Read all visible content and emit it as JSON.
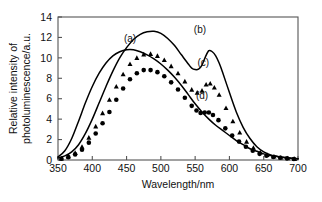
{
  "chart_data": {
    "type": "line",
    "title": "",
    "xlabel": "Wavelength/nm",
    "ylabel": "Relative intensity of photoluminescence/a.u.",
    "xlim": [
      350,
      700
    ],
    "ylim": [
      0,
      14
    ],
    "xticks": [
      350,
      400,
      450,
      500,
      550,
      600,
      650,
      700
    ],
    "yticks": [
      0,
      2,
      4,
      6,
      8,
      10,
      12,
      14
    ],
    "grid": false,
    "legend_position": "inline-annotations",
    "annotations": [
      {
        "text": "(a)",
        "x": 455,
        "y": 11.6
      },
      {
        "text": "(b)",
        "x": 557,
        "y": 12.4
      },
      {
        "text": "(c)",
        "x": 562,
        "y": 9.2
      },
      {
        "text": "(d)",
        "x": 560,
        "y": 6.0
      }
    ],
    "series": [
      {
        "name": "(a)",
        "label": "(a)",
        "style": "solid-line",
        "marker": "none",
        "color": "#000000",
        "x": [
          350,
          360,
          370,
          380,
          390,
          400,
          410,
          420,
          430,
          440,
          450,
          460,
          470,
          480,
          490,
          500,
          510,
          520,
          530,
          540,
          550,
          560,
          570,
          580,
          590,
          600,
          610,
          620,
          630,
          640,
          650,
          660,
          670,
          680,
          690,
          700
        ],
        "y": [
          0.3,
          0.9,
          2.1,
          3.8,
          5.6,
          7.2,
          8.5,
          9.5,
          10.2,
          10.6,
          10.8,
          10.8,
          10.6,
          10.3,
          9.9,
          9.4,
          8.8,
          8.1,
          7.3,
          6.4,
          5.5,
          4.7,
          4.0,
          3.4,
          2.9,
          2.4,
          1.9,
          1.5,
          1.1,
          0.85,
          0.6,
          0.45,
          0.35,
          0.25,
          0.18,
          0.12
        ]
      },
      {
        "name": "(b)",
        "label": "(b)",
        "style": "solid-line",
        "marker": "none",
        "color": "#000000",
        "x": [
          350,
          360,
          370,
          380,
          390,
          400,
          410,
          420,
          430,
          440,
          450,
          460,
          470,
          480,
          490,
          500,
          510,
          520,
          530,
          540,
          545,
          550,
          555,
          560,
          565,
          570,
          575,
          580,
          585,
          590,
          600,
          610,
          620,
          630,
          640,
          650,
          660,
          670,
          680,
          690,
          700
        ],
        "y": [
          0.2,
          0.4,
          0.8,
          1.5,
          2.6,
          4.0,
          5.6,
          7.2,
          8.7,
          10.0,
          11.0,
          11.8,
          12.3,
          12.55,
          12.6,
          12.4,
          11.9,
          11.2,
          10.3,
          9.4,
          9.0,
          8.85,
          8.9,
          9.3,
          10.1,
          10.7,
          10.6,
          10.2,
          9.5,
          8.6,
          6.6,
          4.7,
          3.2,
          2.1,
          1.3,
          0.8,
          0.5,
          0.35,
          0.25,
          0.18,
          0.12
        ]
      },
      {
        "name": "(c)",
        "label": "(c)",
        "style": "markers",
        "marker": "triangle",
        "color": "#000000",
        "x": [
          355,
          365,
          375,
          385,
          395,
          405,
          415,
          425,
          435,
          445,
          455,
          465,
          475,
          485,
          495,
          505,
          515,
          525,
          535,
          545,
          553,
          560,
          566,
          572,
          578,
          585,
          595,
          605,
          615,
          625,
          635,
          645,
          655,
          665,
          675,
          685,
          695
        ],
        "y": [
          0.15,
          0.35,
          0.7,
          1.3,
          2.2,
          3.3,
          4.6,
          5.9,
          7.2,
          8.4,
          9.4,
          10.0,
          10.35,
          10.4,
          10.2,
          9.8,
          9.2,
          8.5,
          7.7,
          6.9,
          6.6,
          6.8,
          7.4,
          7.5,
          7.1,
          6.4,
          5.1,
          3.8,
          2.7,
          1.8,
          1.2,
          0.75,
          0.5,
          0.35,
          0.25,
          0.18,
          0.12
        ]
      },
      {
        "name": "(d)",
        "label": "(d)",
        "style": "markers",
        "marker": "circle",
        "color": "#000000",
        "x": [
          355,
          365,
          375,
          385,
          395,
          405,
          415,
          425,
          435,
          445,
          455,
          465,
          475,
          485,
          495,
          505,
          515,
          525,
          535,
          545,
          552,
          558,
          564,
          570,
          576,
          584,
          594,
          604,
          614,
          624,
          634,
          644,
          654,
          664,
          674,
          684,
          694
        ],
        "y": [
          0.12,
          0.28,
          0.55,
          1.0,
          1.7,
          2.6,
          3.6,
          4.7,
          5.9,
          7.0,
          7.9,
          8.5,
          8.8,
          8.8,
          8.6,
          8.2,
          7.6,
          6.9,
          6.1,
          5.3,
          4.85,
          4.6,
          4.65,
          4.65,
          4.4,
          3.9,
          3.1,
          2.4,
          1.8,
          1.3,
          0.9,
          0.6,
          0.42,
          0.3,
          0.22,
          0.16,
          0.1
        ]
      }
    ]
  }
}
